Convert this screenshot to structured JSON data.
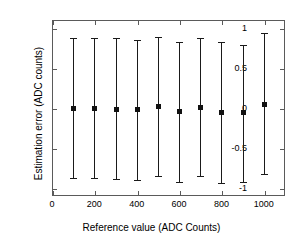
{
  "chart_data": {
    "type": "scatter",
    "title": "",
    "subtitle": "",
    "xlabel": "Reference value (ADC Counts)",
    "ylabel": "Estimation error (ADC counts)",
    "xlim": [
      0,
      1100
    ],
    "ylim": [
      -1.1,
      1.1
    ],
    "xticks": [
      0,
      200,
      400,
      600,
      800,
      1000
    ],
    "xtick_labels": [
      "0",
      "200",
      "400",
      "600",
      "800",
      "1000"
    ],
    "yticks": [
      1,
      0.5,
      0,
      -0.5,
      -1
    ],
    "ytick_labels": [
      "1",
      "0.5",
      "0",
      "-0.5",
      "-1"
    ],
    "grid": false,
    "legend": null,
    "marker": "square",
    "marker_color": "#111111",
    "line_color": "#1a1a1a",
    "x": [
      100,
      200,
      300,
      400,
      500,
      600,
      700,
      800,
      900,
      1000
    ],
    "values": [
      0.0,
      -0.01,
      -0.02,
      -0.02,
      0.02,
      -0.04,
      0.01,
      -0.06,
      -0.06,
      0.05
    ],
    "err_upper": [
      0.88,
      0.87,
      0.88,
      0.85,
      0.89,
      0.83,
      0.88,
      0.82,
      0.79,
      0.94
    ],
    "err_lower": [
      -0.87,
      -0.88,
      -0.89,
      -0.9,
      -0.85,
      -0.92,
      -0.85,
      -0.94,
      -0.92,
      -0.82
    ],
    "series": [
      {
        "name": "Estimation error",
        "values": [
          0.0,
          -0.01,
          -0.02,
          -0.02,
          0.02,
          -0.04,
          0.01,
          -0.06,
          -0.06,
          0.05
        ]
      }
    ]
  },
  "axes": {
    "frame_color": "#5a5a5a"
  }
}
